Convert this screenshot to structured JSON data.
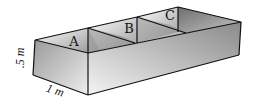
{
  "diagram": {
    "compartments": [
      {
        "label": "A"
      },
      {
        "label": "B"
      },
      {
        "label": "C"
      }
    ],
    "dimensions": {
      "height": ".5 m",
      "width": "1 m"
    },
    "colors": {
      "edge": "#111111",
      "face_light": "#f2f2f2",
      "face_dark": "#8c8c8c"
    }
  }
}
